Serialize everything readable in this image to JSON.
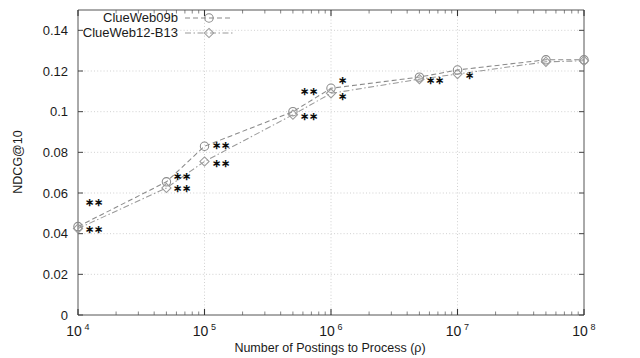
{
  "chart_data": {
    "type": "line",
    "title": "",
    "xlabel": "Number of Postings to Process (ρ)",
    "ylabel": "NDCG@10",
    "xscale": "log",
    "xlim": [
      10000,
      100000000
    ],
    "ylim": [
      0,
      0.15
    ],
    "grid": true,
    "legend_position": "top-left",
    "y_ticks": [
      "0",
      "0.02",
      "0.04",
      "0.06",
      "0.08",
      "0.1",
      "0.12",
      "0.14"
    ],
    "y_tick_values": [
      0,
      0.02,
      0.04,
      0.06,
      0.08,
      0.1,
      0.12,
      0.14
    ],
    "x_ticks": [
      {
        "mantissa": "10",
        "exponent": "4",
        "value": 10000
      },
      {
        "mantissa": "10",
        "exponent": "5",
        "value": 100000
      },
      {
        "mantissa": "10",
        "exponent": "6",
        "value": 1000000
      },
      {
        "mantissa": "10",
        "exponent": "7",
        "value": 10000000
      },
      {
        "mantissa": "10",
        "exponent": "8",
        "value": 100000000
      }
    ],
    "series": [
      {
        "name": "ClueWeb09b",
        "marker": "circle-open",
        "linestyle": "dashed",
        "color": "#8a8a8a",
        "x": [
          10000,
          50000,
          100000,
          500000,
          1000000,
          5000000,
          10000000,
          50000000,
          100000000
        ],
        "values": [
          0.0435,
          0.0655,
          0.083,
          0.1,
          0.1115,
          0.117,
          0.1205,
          0.1255,
          0.1255
        ]
      },
      {
        "name": "ClueWeb12-B13",
        "marker": "diamond-open",
        "linestyle": "dash-dot",
        "color": "#9a9a9a",
        "x": [
          10000,
          50000,
          100000,
          500000,
          1000000,
          5000000,
          10000000,
          50000000,
          100000000
        ],
        "values": [
          0.0425,
          0.0625,
          0.0755,
          0.0985,
          0.109,
          0.116,
          0.1185,
          0.1245,
          0.125
        ]
      }
    ],
    "significance_annotations": [
      {
        "x": 10000,
        "y": 0.0555,
        "marks": "∗∗"
      },
      {
        "x": 10000,
        "y": 0.042,
        "marks": "∗∗"
      },
      {
        "x": 50000,
        "y": 0.068,
        "marks": "∗∗"
      },
      {
        "x": 50000,
        "y": 0.062,
        "marks": "∗∗"
      },
      {
        "x": 100000,
        "y": 0.0835,
        "marks": "∗∗"
      },
      {
        "x": 100000,
        "y": 0.0745,
        "marks": "∗∗"
      },
      {
        "x": 500000,
        "y": 0.11,
        "marks": "∗∗"
      },
      {
        "x": 500000,
        "y": 0.0975,
        "marks": "∗∗"
      },
      {
        "x": 1000000,
        "y": 0.1155,
        "marks": "∗"
      },
      {
        "x": 1000000,
        "y": 0.1075,
        "marks": "∗"
      },
      {
        "x": 5000000,
        "y": 0.1155,
        "marks": "∗∗"
      },
      {
        "x": 10000000,
        "y": 0.118,
        "marks": "∗"
      }
    ]
  },
  "legend": {
    "items": [
      {
        "label": "ClueWeb09b"
      },
      {
        "label": "ClueWeb12-B13"
      }
    ]
  },
  "axes": {
    "y_label": "NDCG@10",
    "x_label": "Number of Postings to Process (ρ)"
  },
  "colors": {
    "series_1": "#8a8a8a",
    "series_2": "#9a9a9a",
    "axis": "#5a5a5a",
    "grid": "#cccccc",
    "text": "#1a1a1a"
  }
}
